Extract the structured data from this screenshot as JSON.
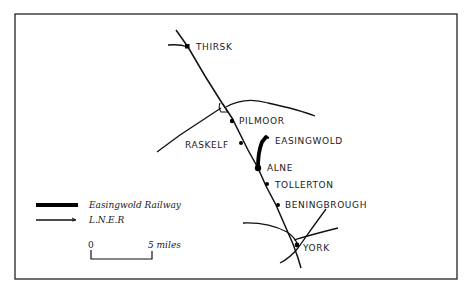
{
  "map": {
    "title": "",
    "stations": [
      {
        "name": "THIRSK"
      },
      {
        "name": "PILMOOR"
      },
      {
        "name": "RASKELF"
      },
      {
        "name": "EASINGWOLD"
      },
      {
        "name": "ALNE"
      },
      {
        "name": "TOLLERTON"
      },
      {
        "name": "BENINGBROUGH"
      },
      {
        "name": "YORK"
      }
    ],
    "legend": {
      "items": [
        {
          "label": "Easingwold Railway",
          "style": "thick"
        },
        {
          "label": "L.N.E.R",
          "style": "thin"
        }
      ]
    },
    "scale": {
      "start": "0",
      "end": "5 miles"
    },
    "colors": {
      "line": "#111111",
      "background": "#ffffff"
    }
  }
}
